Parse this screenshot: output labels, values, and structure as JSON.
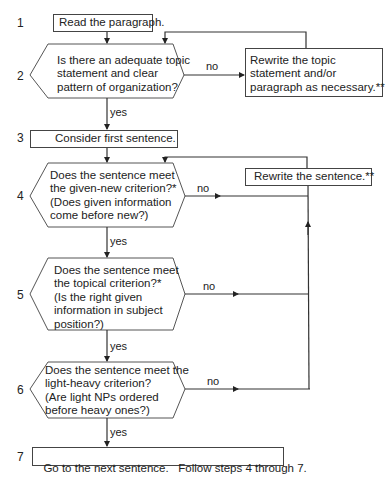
{
  "flowchart": {
    "steps": [
      {
        "number": "1",
        "type": "process",
        "text": "Read the paragraph."
      },
      {
        "number": "2",
        "type": "decision",
        "lines": [
          "Is there an adequate topic",
          "statement and clear",
          "pattern of organization?"
        ]
      },
      {
        "number": "3",
        "type": "process",
        "text": "Consider first sentence."
      },
      {
        "number": "4",
        "type": "decision",
        "lines": [
          "Does the sentence meet",
          "the given-new criterion?*",
          "(Does given information",
          "come before new?)"
        ]
      },
      {
        "number": "5",
        "type": "decision",
        "lines": [
          "Does the sentence meet",
          "the topical criterion?*",
          "(Is the right given",
          "information in subject",
          "position?)"
        ]
      },
      {
        "number": "6",
        "type": "decision",
        "lines": [
          "Does the sentence meet the",
          "light-heavy criterion?",
          "(Are light NPs ordered",
          "before heavy ones?)"
        ]
      },
      {
        "number": "7",
        "type": "process",
        "text": "Go to the next sentence.   Follow steps 4 through 7."
      }
    ],
    "rewrite_topic": {
      "lines": [
        "Rewrite the topic",
        "statement and/or",
        "paragraph as necessary.**"
      ]
    },
    "rewrite_sentence": {
      "text": "Rewrite the sentence.**"
    },
    "edge_labels": {
      "yes": "yes",
      "no": "no"
    }
  }
}
